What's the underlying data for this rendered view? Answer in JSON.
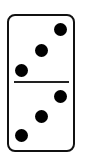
{
  "domino": {
    "top_half": {
      "pips": 3
    },
    "bottom_half": {
      "pips": 3
    },
    "colors": {
      "border": "#111111",
      "pip": "#000000",
      "face": "#ffffff"
    }
  }
}
